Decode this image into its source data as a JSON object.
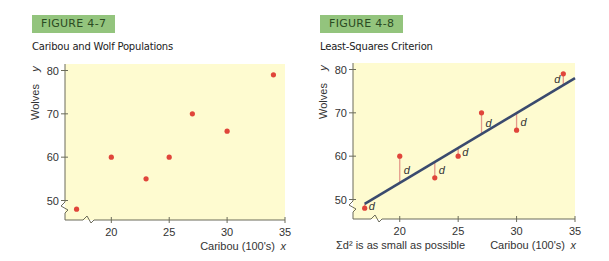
{
  "figures": [
    {
      "badge": "FIGURE 4-7",
      "title": "Caribou and Wolf Populations"
    },
    {
      "badge": "FIGURE 4-8",
      "title": "Least-Squares Criterion"
    }
  ],
  "chart_data": [
    {
      "type": "scatter",
      "title": "Caribou and Wolf Populations",
      "xlabel": "Caribou (100's)",
      "xvar": "x",
      "ylabel": "Wolves",
      "yvar": "y",
      "xlim": [
        16,
        35
      ],
      "ylim": [
        45.5,
        81.5
      ],
      "xticks": [
        20,
        25,
        30,
        35
      ],
      "yticks": [
        50,
        60,
        70,
        80
      ],
      "axis_break": true,
      "grid": false,
      "background": "#fefbd0",
      "point_color": "#e0453a",
      "points": [
        [
          17,
          48
        ],
        [
          20,
          60
        ],
        [
          23,
          55
        ],
        [
          25,
          60
        ],
        [
          27,
          70
        ],
        [
          30,
          66
        ],
        [
          34,
          79
        ]
      ]
    },
    {
      "type": "scatter",
      "title": "Least-Squares Criterion",
      "xlabel": "Caribou (100's)",
      "xvar": "x",
      "ylabel": "Wolves",
      "yvar": "y",
      "xlim": [
        16,
        35
      ],
      "ylim": [
        45.5,
        81.5
      ],
      "xticks": [
        20,
        25,
        30,
        35
      ],
      "yticks": [
        50,
        60,
        70,
        80
      ],
      "axis_break": true,
      "grid": false,
      "background": "#fefbd0",
      "point_color": "#e0453a",
      "line_color": "#3a4a6e",
      "residual_color": "#e59a8a",
      "points": [
        [
          17,
          48
        ],
        [
          20,
          60
        ],
        [
          23,
          55
        ],
        [
          25,
          60
        ],
        [
          27,
          70
        ],
        [
          30,
          66
        ],
        [
          34,
          79
        ]
      ],
      "regression_line": {
        "x": [
          17,
          35
        ],
        "y": [
          49,
          78
        ]
      },
      "residual_label": "d",
      "annotation": "Σd² is as small as possible"
    }
  ]
}
